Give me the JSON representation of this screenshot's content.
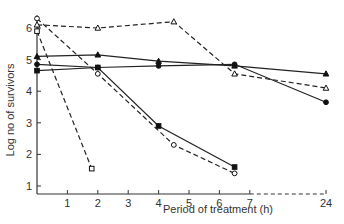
{
  "chart_data": {
    "type": "line",
    "title": "",
    "xlabel": "Period of treatment (h)",
    "ylabel": "Log no of survivors",
    "x_ticks": [
      1,
      2,
      3,
      4,
      5,
      6,
      7,
      24
    ],
    "y_ticks": [
      1,
      2,
      3,
      4,
      5,
      6
    ],
    "x_axis_break": "dashed axis segment between 7 and 24",
    "ylim": [
      0.75,
      6.5
    ],
    "grid": false,
    "legend": "none",
    "series": [
      {
        "name": "open-triangle-dashed",
        "marker": "open-triangle",
        "line": "dashed",
        "x": [
          0,
          2,
          4.5,
          6.5,
          24
        ],
        "y": [
          6.1,
          6.0,
          6.2,
          4.55,
          4.1
        ]
      },
      {
        "name": "filled-triangle-solid",
        "marker": "filled-triangle",
        "line": "solid",
        "x": [
          0,
          2,
          4,
          6.5,
          24
        ],
        "y": [
          5.1,
          5.15,
          4.95,
          4.8,
          4.55
        ]
      },
      {
        "name": "filled-circle-solid",
        "marker": "filled-circle",
        "line": "solid",
        "x": [
          0,
          2,
          4,
          6.5,
          24
        ],
        "y": [
          4.85,
          4.75,
          4.8,
          4.85,
          3.65
        ]
      },
      {
        "name": "filled-square-solid",
        "marker": "filled-square",
        "line": "solid",
        "x": [
          0,
          2,
          4,
          6.5
        ],
        "y": [
          4.65,
          4.75,
          2.9,
          1.6
        ]
      },
      {
        "name": "open-circle-dashed",
        "marker": "open-circle",
        "line": "dashed",
        "x": [
          0,
          2,
          4.5,
          6.5
        ],
        "y": [
          6.3,
          4.55,
          2.3,
          1.4
        ]
      },
      {
        "name": "open-square-dashed",
        "marker": "open-square",
        "line": "dashed",
        "x": [
          0,
          1.8
        ],
        "y": [
          5.9,
          1.55
        ]
      }
    ]
  }
}
